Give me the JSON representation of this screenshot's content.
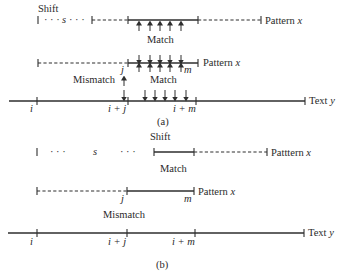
{
  "figure": {
    "panel_a": {
      "caption": "(a)",
      "shift_label": "Shift",
      "shift_var": "s",
      "shift_dots": "· · ·",
      "match_label_upper": "Match",
      "match_label_lower": "Match",
      "mismatch_label": "Mismatch",
      "pattern_label_shifted": "Pattern",
      "pattern_label_current": "Pattern",
      "pattern_var": "x",
      "text_label": "Text",
      "text_var": "y",
      "pattern_tick_j": "j",
      "pattern_tick_m": "m",
      "text_tick_i": "i",
      "text_tick_ij": "i + j",
      "text_tick_im": "i + m"
    },
    "panel_b": {
      "caption": "(b)",
      "shift_label": "Shift",
      "shift_var": "s",
      "shift_dots_left": "· · ·",
      "shift_dots_right": "· · ·",
      "match_label": "Match",
      "mismatch_label": "Mismatch",
      "pattern_label_shifted": "Patttern",
      "pattern_label_current": "Pattern",
      "pattern_var": "x",
      "text_label": "Text",
      "text_var": "y",
      "pattern_tick_j": "j",
      "pattern_tick_m": "m",
      "text_tick_i": "i",
      "text_tick_ij": "i + j",
      "text_tick_im": "i + m"
    },
    "colors": {
      "ink": "#2e2e2e",
      "background": "#ffffff"
    }
  }
}
